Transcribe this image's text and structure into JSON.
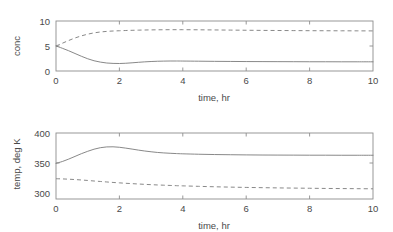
{
  "figure": {
    "background": "#ffffff",
    "line_color": "#7a7a7a",
    "axis_color": "#8d8d8d",
    "text_color": "#4a4a4a"
  },
  "chart_data": [
    {
      "type": "line",
      "id": "concentration-vs-time",
      "title": "",
      "xlabel": "time, hr",
      "ylabel": "conc",
      "xlim": [
        0,
        10
      ],
      "ylim": [
        0,
        10
      ],
      "xticks": [
        0,
        2,
        4,
        6,
        8,
        10
      ],
      "yticks": [
        0,
        5,
        10
      ],
      "xticklabels": [
        "0",
        "2",
        "4",
        "6",
        "8",
        "10"
      ],
      "yticklabels": [
        "0",
        "5",
        "10"
      ],
      "grid": false,
      "legend": null,
      "x": [
        0,
        0.2,
        0.4,
        0.6,
        0.8,
        1.0,
        1.2,
        1.4,
        1.6,
        1.8,
        2.0,
        2.2,
        2.4,
        2.6,
        2.8,
        3.0,
        3.2,
        3.4,
        3.6,
        3.8,
        4.0,
        4.5,
        5.0,
        5.5,
        6.0,
        6.5,
        7.0,
        7.5,
        8.0,
        8.5,
        9.0,
        9.5,
        10.0
      ],
      "series": [
        {
          "name": "solid",
          "style": "solid",
          "values": [
            5.0,
            4.55,
            4.05,
            3.5,
            2.95,
            2.45,
            2.05,
            1.78,
            1.6,
            1.52,
            1.5,
            1.55,
            1.64,
            1.74,
            1.83,
            1.9,
            1.95,
            1.98,
            2.0,
            2.0,
            1.99,
            1.96,
            1.93,
            1.91,
            1.89,
            1.88,
            1.87,
            1.86,
            1.85,
            1.85,
            1.84,
            1.84,
            1.84
          ]
        },
        {
          "name": "dashed",
          "style": "dashed",
          "values": [
            5.0,
            5.55,
            6.1,
            6.6,
            7.02,
            7.36,
            7.62,
            7.8,
            7.92,
            8.0,
            8.05,
            8.1,
            8.14,
            8.17,
            8.2,
            8.22,
            8.24,
            8.25,
            8.26,
            8.26,
            8.26,
            8.24,
            8.21,
            8.18,
            8.15,
            8.12,
            8.1,
            8.08,
            8.06,
            8.05,
            8.04,
            8.03,
            8.02
          ]
        }
      ]
    },
    {
      "type": "line",
      "id": "temperature-vs-time",
      "title": "",
      "xlabel": "time, hr",
      "ylabel": "temp, deg K",
      "xlim": [
        0,
        10
      ],
      "ylim": [
        290,
        400
      ],
      "xticks": [
        0,
        2,
        4,
        6,
        8,
        10
      ],
      "yticks": [
        300,
        350,
        400
      ],
      "xticklabels": [
        "0",
        "2",
        "4",
        "6",
        "8",
        "10"
      ],
      "yticklabels": [
        "300",
        "350",
        "400"
      ],
      "grid": false,
      "legend": null,
      "x": [
        0,
        0.2,
        0.4,
        0.6,
        0.8,
        1.0,
        1.2,
        1.4,
        1.6,
        1.8,
        2.0,
        2.2,
        2.4,
        2.6,
        2.8,
        3.0,
        3.2,
        3.4,
        3.6,
        3.8,
        4.0,
        4.5,
        5.0,
        5.5,
        6.0,
        6.5,
        7.0,
        7.5,
        8.0,
        8.5,
        9.0,
        9.5,
        10.0
      ],
      "series": [
        {
          "name": "solid",
          "style": "solid",
          "values": [
            349.5,
            352.5,
            356.5,
            361.0,
            365.5,
            369.5,
            373.0,
            375.5,
            376.8,
            377.0,
            376.2,
            374.8,
            373.2,
            371.5,
            370.0,
            368.7,
            367.6,
            366.8,
            366.2,
            365.7,
            365.3,
            364.6,
            364.1,
            363.8,
            363.5,
            363.3,
            363.2,
            363.1,
            363.0,
            363.0,
            362.9,
            362.9,
            362.9
          ]
        },
        {
          "name": "dashed",
          "style": "dashed",
          "values": [
            323.8,
            323.5,
            323.0,
            322.4,
            321.7,
            320.9,
            320.0,
            319.2,
            318.4,
            317.6,
            316.9,
            316.2,
            315.6,
            315.0,
            314.4,
            313.9,
            313.4,
            313.0,
            312.6,
            312.2,
            311.9,
            311.1,
            310.4,
            309.8,
            309.3,
            308.9,
            308.5,
            308.2,
            307.9,
            307.6,
            307.4,
            307.2,
            307.0
          ]
        }
      ]
    }
  ]
}
